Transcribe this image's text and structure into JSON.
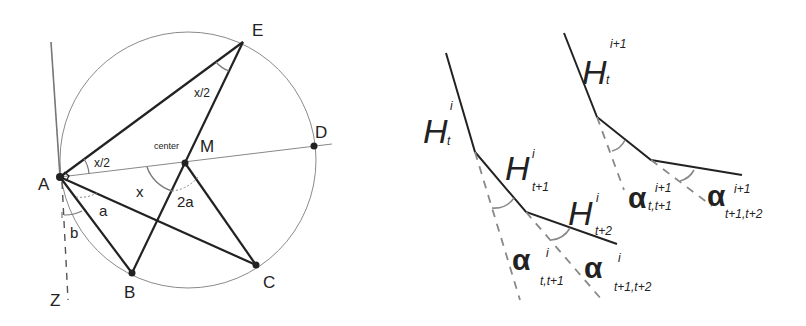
{
  "left_figure": {
    "points": {
      "A": "A",
      "B": "B",
      "C": "C",
      "D": "D",
      "E": "E",
      "M": "M",
      "Z": "Z"
    },
    "center_label": "center",
    "angles": {
      "x_half_at_A": "x/2",
      "x_half_at_E": "x/2",
      "x_at_M": "x",
      "two_a_at_M": "2a",
      "a_at_A": "a",
      "b_at_A": "b"
    }
  },
  "right_figure": {
    "chain_i": {
      "H_t": {
        "base": "H",
        "sub": "t",
        "sup": "i"
      },
      "H_t1": {
        "base": "H",
        "sub": "t+1",
        "sup": "i"
      },
      "H_t2": {
        "base": "H",
        "sub": "t+2",
        "sup": "i"
      },
      "alpha_1": {
        "base": "α",
        "sub": "t,t+1",
        "sup": "i"
      },
      "alpha_2": {
        "base": "α",
        "sub": "t+1,t+2",
        "sup": "i"
      }
    },
    "chain_i1": {
      "H_t": {
        "base": "H",
        "sub": "t",
        "sup": "i+1"
      },
      "alpha_1": {
        "base": "α",
        "sub": "t,t+1",
        "sup": "i+1"
      },
      "alpha_2": {
        "base": "α",
        "sub": "t+1,t+2",
        "sup": "i+1"
      }
    }
  },
  "colors": {
    "line": "#222222",
    "circle": "#8a8a8a",
    "dashed": "#8a8a8a"
  }
}
